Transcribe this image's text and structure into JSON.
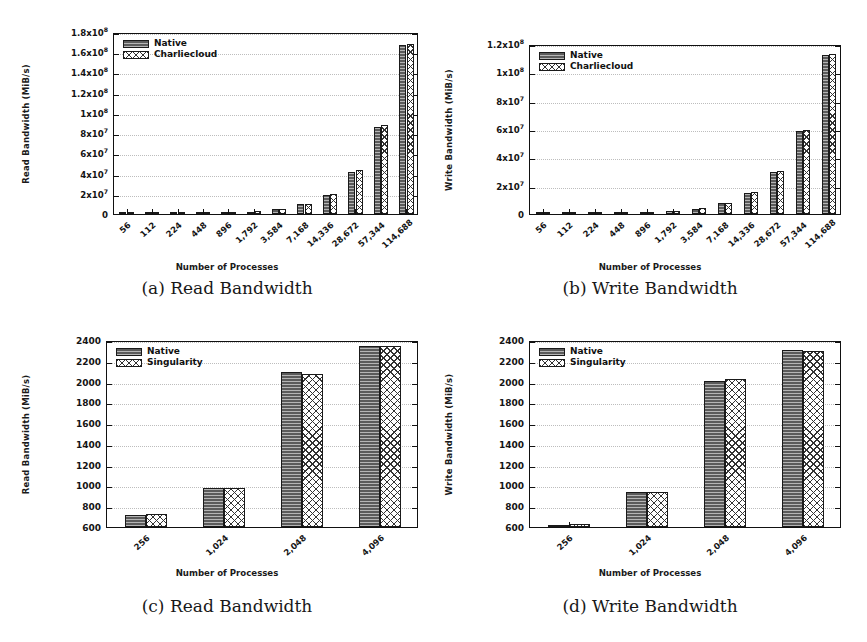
{
  "figure": {
    "panels": [
      {
        "id": "a",
        "caption": "(a) Read Bandwidth",
        "legend": [
          "Native",
          "Charliecloud"
        ],
        "chart_data": {
          "type": "bar",
          "title": "",
          "xlabel": "Number of Processes",
          "ylabel": "Read Bandwidth (MiB/s)",
          "categories": [
            "56",
            "112",
            "224",
            "448",
            "896",
            "1,792",
            "3,584",
            "7,168",
            "14,336",
            "28,672",
            "57,344",
            "114,688"
          ],
          "ytick_labels": [
            "0",
            "2x10⁷",
            "4x10⁷",
            "6x10⁷",
            "8x10⁷",
            "1x10⁸",
            "1.2x10⁸",
            "1.4x10⁸",
            "1.6x10⁸",
            "1.8x10⁸"
          ],
          "ytick_values": [
            0,
            20000000,
            40000000,
            60000000,
            80000000,
            100000000,
            120000000,
            140000000,
            160000000,
            180000000
          ],
          "ylim": [
            0,
            180000000
          ],
          "grid": true,
          "legend_position": "top-left",
          "series": [
            {
              "name": "Native",
              "values": [
                70000,
                150000,
                300000,
                600000,
                1200000,
                2400000,
                4800000,
                9600000,
                19200000,
                42000000,
                86000000,
                167000000
              ]
            },
            {
              "name": "Charliecloud",
              "values": [
                70000,
                150000,
                300000,
                620000,
                1250000,
                2500000,
                5000000,
                10000000,
                20000000,
                44000000,
                88000000,
                168000000
              ]
            }
          ]
        }
      },
      {
        "id": "b",
        "caption": "(b) Write Bandwidth",
        "legend": [
          "Native",
          "Charliecloud"
        ],
        "chart_data": {
          "type": "bar",
          "title": "",
          "xlabel": "Number of Processes",
          "ylabel": "Write Bandwidth (MiB/s)",
          "categories": [
            "56",
            "112",
            "224",
            "448",
            "896",
            "1,792",
            "3,584",
            "7,168",
            "14,336",
            "28,672",
            "57,344",
            "114,688"
          ],
          "ytick_labels": [
            "0",
            "2x10⁷",
            "4x10⁷",
            "6x10⁷",
            "8x10⁷",
            "1x10⁸",
            "1.2x10⁸"
          ],
          "ytick_values": [
            0,
            20000000,
            40000000,
            60000000,
            80000000,
            100000000,
            120000000
          ],
          "ylim": [
            0,
            120000000
          ],
          "grid": true,
          "legend_position": "top-left",
          "series": [
            {
              "name": "Native",
              "values": [
                60000,
                120000,
                250000,
                500000,
                1000000,
                2000000,
                3800000,
                7600000,
                15000000,
                29500000,
                58500000,
                112000000
              ]
            },
            {
              "name": "Charliecloud",
              "values": [
                60000,
                120000,
                250000,
                520000,
                1050000,
                2100000,
                4000000,
                8000000,
                15500000,
                30500000,
                59500000,
                113000000
              ]
            }
          ]
        }
      },
      {
        "id": "c",
        "caption": "(c) Read Bandwidth",
        "legend": [
          "Native",
          "Singularity"
        ],
        "chart_data": {
          "type": "bar",
          "title": "",
          "xlabel": "Number of Processes",
          "ylabel": "Read Bandwidth (MiB/s)",
          "categories": [
            "256",
            "1,024",
            "2,048",
            "4,096"
          ],
          "ytick_labels": [
            "600",
            "800",
            "1000",
            "1200",
            "1400",
            "1600",
            "1800",
            "2000",
            "2200",
            "2400"
          ],
          "ytick_values": [
            600,
            800,
            1000,
            1200,
            1400,
            1600,
            1800,
            2000,
            2200,
            2400
          ],
          "ylim": [
            600,
            2400
          ],
          "grid": true,
          "legend_position": "top-left",
          "series": [
            {
              "name": "Native",
              "values": [
                718,
                975,
                2090,
                2340
              ]
            },
            {
              "name": "Singularity",
              "values": [
                722,
                972,
                2075,
                2342
              ]
            }
          ]
        }
      },
      {
        "id": "d",
        "caption": "(d) Write Bandwidth",
        "legend": [
          "Native",
          "Singularity"
        ],
        "chart_data": {
          "type": "bar",
          "title": "",
          "xlabel": "Number of Processes",
          "ylabel": "Write Bandwidth (MiB/s)",
          "categories": [
            "256",
            "1,024",
            "2,048",
            "4,096"
          ],
          "ytick_labels": [
            "600",
            "800",
            "1000",
            "1200",
            "1400",
            "1600",
            "1800",
            "2000",
            "2200",
            "2400"
          ],
          "ytick_values": [
            600,
            800,
            1000,
            1200,
            1400,
            1600,
            1800,
            2000,
            2200,
            2400
          ],
          "ylim": [
            600,
            2400
          ],
          "grid": true,
          "legend_position": "top-left",
          "series": [
            {
              "name": "Native",
              "values": [
                622,
                938,
                2010,
                2300
              ]
            },
            {
              "name": "Singularity",
              "values": [
                628,
                935,
                2022,
                2292
              ]
            }
          ]
        }
      }
    ]
  },
  "style": {
    "native_color": "#5b5b5b",
    "alt_color": "#ffffff",
    "axis_color": "#111111",
    "grid_color": "#bdbdbd"
  }
}
